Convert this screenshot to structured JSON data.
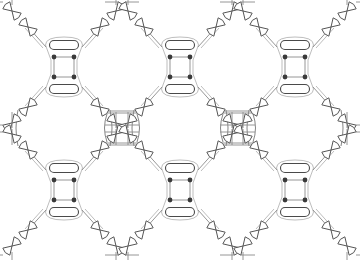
{
  "diagram": {
    "type": "periodic-lattice",
    "width": 360,
    "height": 260,
    "colors": {
      "background": "#ffffff",
      "outline": "#4a4a4a",
      "wire": "#8a8a8a",
      "wire_light": "#b5b5b5",
      "node": "#3a3a3a"
    },
    "unit_cell": {
      "description": "Square plaquette with 4 nodes, flanked above and below by pill-shaped elements, with 4 diagonal arms each ending in a pair of bowtie (double rounded-triangle) couplers",
      "node_spacing": 20,
      "pill_width": 29,
      "pill_height": 9,
      "pill_offset_y": 22,
      "arm_length": 34
    },
    "cells": [
      {
        "id": "r1c1",
        "cx": 64,
        "cy": 67
      },
      {
        "id": "r1c2",
        "cx": 180,
        "cy": 67
      },
      {
        "id": "r1c3",
        "cx": 295,
        "cy": 67
      },
      {
        "id": "r2c1",
        "cx": 64,
        "cy": 190
      },
      {
        "id": "r2c2",
        "cx": 180,
        "cy": 190
      },
      {
        "id": "r2c3",
        "cx": 295,
        "cy": 190
      }
    ],
    "link_squares": [
      {
        "id": "s1",
        "cx": 122,
        "cy": 128
      },
      {
        "id": "s2",
        "cx": 238,
        "cy": 128
      }
    ],
    "rings": [
      {
        "id": "ring-left",
        "cx": 64,
        "cy": 128
      },
      {
        "id": "ring-mid",
        "cx": 180,
        "cy": 128
      },
      {
        "id": "ring-right",
        "cx": 295,
        "cy": 128
      }
    ]
  }
}
